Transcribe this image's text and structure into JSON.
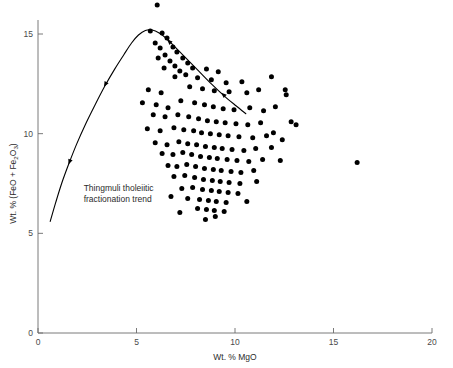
{
  "chart_data": {
    "type": "scatter",
    "title": "",
    "xlabel": "Wt. % MgO",
    "ylabel": "Wt. % (FeO + Fe2O3)",
    "ylabel_parts": {
      "prefix": "Wt. % (FeO + Fe",
      "sub1": "2",
      "mid": "O",
      "sub2": "3",
      "suffix": ")"
    },
    "xlim": [
      0,
      20
    ],
    "ylim": [
      0,
      16.7
    ],
    "xticks": [
      0,
      5,
      10,
      15,
      20
    ],
    "xtick_labels": [
      "0",
      "5",
      "10",
      "15",
      "20"
    ],
    "yticks": [
      0,
      5,
      10,
      15
    ],
    "ytick_labels": [
      "0",
      "5",
      "10",
      "15"
    ],
    "grid": false,
    "legend": null,
    "annotations": [
      {
        "name": "trend-label",
        "line1": "Thingmuli tholeiitic",
        "line2": "fractionation trend",
        "x": 1.2,
        "y": 7.1
      }
    ],
    "series": [
      {
        "name": "basalt analyses",
        "marker": "filled-circle",
        "color": "#000000",
        "marker_size_px": 5,
        "points": [
          [
            6.05,
            16.45
          ],
          [
            5.7,
            15.15
          ],
          [
            6.3,
            15.05
          ],
          [
            6.55,
            14.8
          ],
          [
            5.95,
            14.55
          ],
          [
            6.2,
            14.3
          ],
          [
            6.85,
            14.35
          ],
          [
            7.05,
            14.1
          ],
          [
            6.45,
            13.95
          ],
          [
            6.1,
            13.8
          ],
          [
            6.7,
            13.65
          ],
          [
            7.35,
            13.8
          ],
          [
            7.6,
            13.55
          ],
          [
            6.95,
            13.4
          ],
          [
            6.4,
            13.3
          ],
          [
            7.2,
            13.15
          ],
          [
            7.85,
            13.3
          ],
          [
            8.55,
            13.25
          ],
          [
            9.15,
            13.1
          ],
          [
            7.5,
            12.95
          ],
          [
            6.95,
            12.85
          ],
          [
            8.1,
            12.8
          ],
          [
            8.8,
            12.7
          ],
          [
            9.55,
            12.55
          ],
          [
            10.35,
            12.6
          ],
          [
            5.6,
            12.2
          ],
          [
            6.25,
            12.05
          ],
          [
            7.7,
            12.35
          ],
          [
            8.35,
            12.25
          ],
          [
            8.95,
            12.15
          ],
          [
            9.7,
            12.1
          ],
          [
            10.6,
            12.05
          ],
          [
            11.2,
            12.2
          ],
          [
            5.3,
            11.55
          ],
          [
            6.0,
            11.45
          ],
          [
            6.6,
            11.3
          ],
          [
            7.25,
            11.65
          ],
          [
            7.95,
            11.55
          ],
          [
            8.45,
            11.45
          ],
          [
            8.9,
            11.35
          ],
          [
            9.4,
            11.25
          ],
          [
            9.95,
            11.2
          ],
          [
            10.75,
            11.3
          ],
          [
            11.45,
            11.15
          ],
          [
            12.05,
            11.35
          ],
          [
            5.85,
            10.95
          ],
          [
            6.45,
            10.85
          ],
          [
            7.1,
            10.95
          ],
          [
            7.65,
            10.85
          ],
          [
            8.15,
            10.75
          ],
          [
            8.6,
            10.65
          ],
          [
            9.05,
            10.6
          ],
          [
            9.5,
            10.55
          ],
          [
            10.05,
            10.5
          ],
          [
            10.65,
            10.45
          ],
          [
            11.3,
            10.55
          ],
          [
            12.85,
            10.6
          ],
          [
            13.1,
            10.45
          ],
          [
            5.55,
            10.25
          ],
          [
            6.2,
            10.15
          ],
          [
            6.9,
            10.3
          ],
          [
            7.4,
            10.2
          ],
          [
            7.9,
            10.15
          ],
          [
            8.3,
            10.05
          ],
          [
            8.75,
            10.0
          ],
          [
            9.2,
            9.95
          ],
          [
            9.65,
            9.9
          ],
          [
            10.2,
            9.85
          ],
          [
            10.9,
            9.8
          ],
          [
            11.6,
            9.9
          ],
          [
            5.95,
            9.55
          ],
          [
            6.55,
            9.45
          ],
          [
            7.15,
            9.6
          ],
          [
            7.6,
            9.5
          ],
          [
            8.05,
            9.45
          ],
          [
            8.5,
            9.35
          ],
          [
            8.95,
            9.3
          ],
          [
            9.35,
            9.25
          ],
          [
            9.85,
            9.2
          ],
          [
            10.45,
            9.15
          ],
          [
            11.05,
            9.25
          ],
          [
            11.85,
            9.3
          ],
          [
            6.3,
            9.0
          ],
          [
            6.85,
            8.95
          ],
          [
            7.35,
            9.05
          ],
          [
            7.8,
            8.95
          ],
          [
            8.25,
            8.85
          ],
          [
            8.7,
            8.8
          ],
          [
            9.1,
            8.75
          ],
          [
            9.6,
            8.7
          ],
          [
            10.1,
            8.65
          ],
          [
            10.7,
            8.6
          ],
          [
            11.4,
            8.7
          ],
          [
            12.3,
            8.65
          ],
          [
            6.6,
            8.4
          ],
          [
            7.05,
            8.35
          ],
          [
            7.55,
            8.45
          ],
          [
            8.0,
            8.35
          ],
          [
            8.45,
            8.25
          ],
          [
            8.9,
            8.2
          ],
          [
            9.3,
            8.15
          ],
          [
            9.8,
            8.1
          ],
          [
            10.3,
            8.05
          ],
          [
            10.95,
            8.15
          ],
          [
            16.2,
            8.55
          ],
          [
            6.9,
            7.85
          ],
          [
            7.45,
            7.9
          ],
          [
            7.95,
            7.8
          ],
          [
            8.4,
            7.7
          ],
          [
            8.85,
            7.65
          ],
          [
            9.25,
            7.6
          ],
          [
            9.7,
            7.55
          ],
          [
            10.25,
            7.5
          ],
          [
            11.1,
            7.6
          ],
          [
            7.3,
            7.25
          ],
          [
            7.85,
            7.3
          ],
          [
            8.35,
            7.2
          ],
          [
            8.8,
            7.15
          ],
          [
            9.2,
            7.1
          ],
          [
            9.65,
            7.05
          ],
          [
            10.15,
            7.0
          ],
          [
            6.75,
            6.85
          ],
          [
            7.6,
            6.75
          ],
          [
            8.2,
            6.7
          ],
          [
            8.65,
            6.65
          ],
          [
            9.05,
            6.6
          ],
          [
            9.55,
            6.55
          ],
          [
            10.6,
            6.6
          ],
          [
            8.1,
            6.25
          ],
          [
            8.55,
            6.2
          ],
          [
            8.95,
            6.15
          ],
          [
            9.45,
            6.1
          ],
          [
            7.2,
            6.05
          ],
          [
            11.85,
            12.85
          ],
          [
            12.55,
            12.2
          ],
          [
            12.6,
            11.95
          ],
          [
            11.95,
            10.05
          ],
          [
            12.4,
            9.7
          ],
          [
            9.0,
            5.85
          ],
          [
            8.5,
            5.7
          ]
        ]
      }
    ],
    "curve": {
      "name": "Thingmuli tholeiitic fractionation trend",
      "color": "#000000",
      "width_px": 1.1,
      "direction": "arrows point toward decreasing MgO along trend",
      "points": [
        [
          0.62,
          5.6
        ],
        [
          0.9,
          6.55
        ],
        [
          1.2,
          7.5
        ],
        [
          1.55,
          8.45
        ],
        [
          1.95,
          9.45
        ],
        [
          2.4,
          10.45
        ],
        [
          2.9,
          11.45
        ],
        [
          3.4,
          12.4
        ],
        [
          3.9,
          13.25
        ],
        [
          4.35,
          13.95
        ],
        [
          4.75,
          14.55
        ],
        [
          5.1,
          14.95
        ],
        [
          5.45,
          15.18
        ],
        [
          5.8,
          15.2
        ],
        [
          6.15,
          15.05
        ],
        [
          6.55,
          14.75
        ],
        [
          7.0,
          14.3
        ],
        [
          7.55,
          13.75
        ],
        [
          8.15,
          13.15
        ],
        [
          8.8,
          12.5
        ],
        [
          9.45,
          11.9
        ],
        [
          10.05,
          11.4
        ],
        [
          10.55,
          11.0
        ]
      ],
      "arrow_marks": [
        {
          "x": 1.55,
          "y": 8.45
        },
        {
          "x": 3.35,
          "y": 12.35
        },
        {
          "x": 6.55,
          "y": 14.72
        },
        {
          "x": 9.3,
          "y": 12.05
        }
      ]
    }
  },
  "figure": {
    "axis_color": "#6b6b6b",
    "marker_color": "#000000",
    "background": "#ffffff"
  }
}
